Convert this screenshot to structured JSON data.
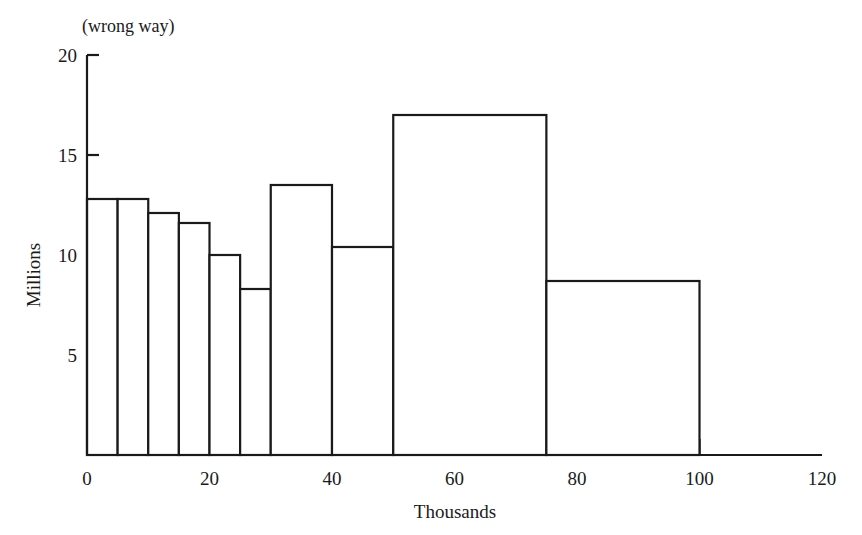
{
  "chart_data": {
    "type": "bar",
    "title": "(wrong way)",
    "xlabel": "Thousands",
    "ylabel": "Millions",
    "xlim": [
      0,
      120
    ],
    "ylim": [
      0,
      20
    ],
    "grid": false,
    "legend": null,
    "x_ticks": [
      0,
      20,
      40,
      60,
      80,
      100,
      120
    ],
    "x_tick_labels": [
      "0",
      "20",
      "40",
      "60",
      "80",
      "100",
      "120"
    ],
    "x_minor_ticks": [
      5,
      10,
      15,
      25,
      30,
      50,
      75
    ],
    "y_ticks": [
      5,
      10,
      15,
      20
    ],
    "y_tick_labels": [
      "5",
      "10",
      "15",
      "20"
    ],
    "bin_edges": [
      0,
      5,
      10,
      15,
      20,
      25,
      30,
      40,
      50,
      75,
      100
    ],
    "bins": [
      {
        "from": 0,
        "to": 5,
        "value": 12.8
      },
      {
        "from": 5,
        "to": 10,
        "value": 12.8
      },
      {
        "from": 10,
        "to": 15,
        "value": 12.1
      },
      {
        "from": 15,
        "to": 20,
        "value": 11.6
      },
      {
        "from": 20,
        "to": 25,
        "value": 10.0
      },
      {
        "from": 25,
        "to": 30,
        "value": 8.3
      },
      {
        "from": 30,
        "to": 40,
        "value": 13.5
      },
      {
        "from": 40,
        "to": 50,
        "value": 10.4
      },
      {
        "from": 50,
        "to": 75,
        "value": 17.0
      },
      {
        "from": 75,
        "to": 100,
        "value": 8.7
      }
    ],
    "categories": [
      "0-5",
      "5-10",
      "10-15",
      "15-20",
      "20-25",
      "25-30",
      "30-40",
      "40-50",
      "50-75",
      "75-100"
    ],
    "values": [
      12.8,
      12.8,
      12.1,
      11.6,
      10.0,
      8.3,
      13.5,
      10.4,
      17.0,
      8.7
    ],
    "colors": {
      "bar_stroke": "#1a1a1a",
      "bar_fill": "#ffffff",
      "axis": "#1a1a1a",
      "background": "#ffffff"
    }
  }
}
